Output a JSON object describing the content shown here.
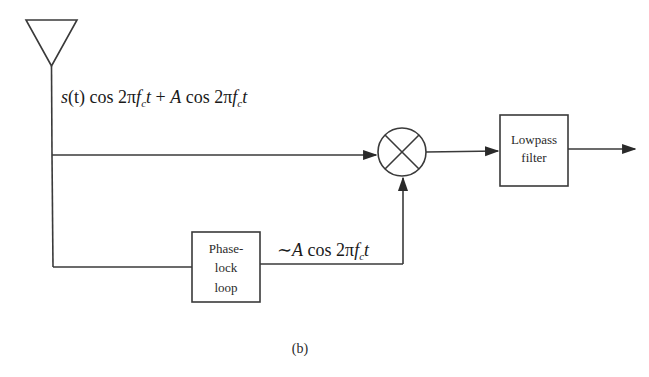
{
  "diagram": {
    "type": "block-diagram",
    "caption": "(b)",
    "input_signal": {
      "s": "s",
      "t": "(t)",
      "cos": " cos 2",
      "pi": "π",
      "f": "f",
      "sub": "c",
      "tvar": "t",
      "plus": " + ",
      "A": "A",
      "cos2": " cos 2",
      "pi2": "π",
      "f2": "f",
      "sub2": "c",
      "tvar2": "t"
    },
    "pll_output": {
      "tilde": "∼",
      "A": "A",
      "cos": " cos 2",
      "pi": "π",
      "f": "f",
      "sub": "c",
      "tvar": "t"
    },
    "blocks": {
      "antenna": "antenna",
      "mixer": "multiplier",
      "pll": {
        "line1": "Phase-",
        "line2": "lock",
        "line3": "loop"
      },
      "lowpass": {
        "line1": "Lowpass",
        "line2": "filter"
      }
    }
  }
}
